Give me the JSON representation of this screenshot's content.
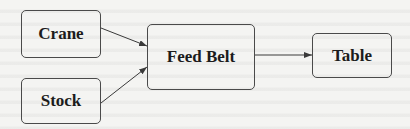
{
  "diagram": {
    "type": "flow",
    "nodes": [
      {
        "id": "crane",
        "label": "Crane"
      },
      {
        "id": "stock",
        "label": "Stock"
      },
      {
        "id": "feed_belt",
        "label": "Feed Belt"
      },
      {
        "id": "table",
        "label": "Table"
      }
    ],
    "edges": [
      {
        "from": "Crane",
        "to": "Feed Belt"
      },
      {
        "from": "Stock",
        "to": "Feed Belt"
      },
      {
        "from": "Feed Belt",
        "to": "Table"
      }
    ],
    "colors": {
      "background": "#f4f4f2",
      "stroke": "#4a4a4a",
      "text": "#1c1c1c"
    }
  }
}
